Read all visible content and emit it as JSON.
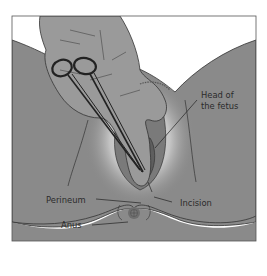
{
  "figure": {
    "labels": {
      "head": [
        "Head of",
        "the fetus"
      ],
      "perineum": "Perineum",
      "incision": "Incision",
      "anus": "Anus"
    },
    "colors": {
      "skin": "#8a8a8a",
      "skin_light": "#d8d8d8",
      "hand": "#9a9a9a",
      "outline": "#333333",
      "fetus_head": "#5e5e5e",
      "background": "#ffffff",
      "frame": "#555555"
    }
  }
}
